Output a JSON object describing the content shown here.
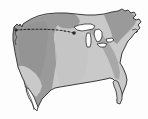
{
  "figure": {
    "name": "united-states-map",
    "width": 148,
    "height": 119,
    "background_color": "#fdfdfd"
  },
  "colors": {
    "background": "#fdfdfd",
    "land_light": "#c9c9c9",
    "land_dark": "#9a9a9a",
    "band_mid": "#a8a8a8",
    "outline": "#3a3a3a",
    "lake_fill": "#ffffff",
    "lake_outline": "#2e2e2e",
    "route_line": "#2a2a2a"
  },
  "regions": [
    {
      "id": "western-dark-region",
      "label": "Western shaded region",
      "fill": "#9a9a9a",
      "shade": "dark"
    },
    {
      "id": "eastern-light-region",
      "label": "Eastern shaded region",
      "fill": "#c9c9c9",
      "shade": "light"
    },
    {
      "id": "central-midtone-band",
      "label": "Diagonal midtone band from Great Lakes to southeast",
      "fill": "#a8a8a8",
      "shade": "medium"
    },
    {
      "id": "northeast-dark-band",
      "label": "Northeast darker band",
      "fill": "#9a9a9a",
      "shade": "dark"
    }
  ],
  "water_bodies": [
    {
      "id": "lake-superior",
      "label": "Lake Superior",
      "fill": "#ffffff"
    },
    {
      "id": "lake-michigan",
      "label": "Lake Michigan",
      "fill": "#ffffff"
    },
    {
      "id": "lake-huron",
      "label": "Lake Huron",
      "fill": "#ffffff"
    },
    {
      "id": "lake-erie",
      "label": "Lake Erie",
      "fill": "#ffffff"
    },
    {
      "id": "lake-ontario",
      "label": "Lake Ontario",
      "fill": "#ffffff"
    }
  ],
  "route": {
    "id": "dashed-route-line",
    "label": "Dashed route line",
    "style": "dashed",
    "color": "#2a2a2a",
    "dash_pattern": "2 2",
    "stroke_width": 1.1,
    "start_point": {
      "x": 16,
      "y": 30
    },
    "end_point": {
      "x": 74,
      "y": 33
    },
    "waypoints": [
      {
        "x": 16,
        "y": 30
      },
      {
        "x": 30,
        "y": 30
      },
      {
        "x": 46,
        "y": 30
      },
      {
        "x": 60,
        "y": 31
      },
      {
        "x": 74,
        "y": 33
      }
    ],
    "endpoint_markers": [
      {
        "x": 16,
        "y": 30,
        "r": 1.6
      },
      {
        "x": 74,
        "y": 33,
        "r": 1.8
      }
    ]
  },
  "landmasses": [
    {
      "id": "contiguous-us",
      "label": "Contiguous United States"
    },
    {
      "id": "baja-peninsula",
      "label": "Baja California peninsula"
    },
    {
      "id": "florida-peninsula",
      "label": "Florida peninsula"
    },
    {
      "id": "cape-cod",
      "label": "Cape Cod and Long Island"
    }
  ],
  "labels": {
    "title": "",
    "caption": "",
    "legend": []
  }
}
